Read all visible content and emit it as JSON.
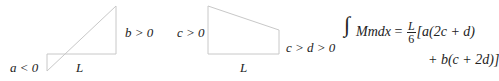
{
  "figure1": {
    "labels": {
      "a": "a < 0",
      "b": "b > 0",
      "length": "L"
    }
  },
  "figure2": {
    "labels": {
      "c": "c > 0",
      "cd": "c > d > 0",
      "length": "L"
    }
  },
  "formula": {
    "integral_sign": "∫",
    "lhs": "Mmdx",
    "equals": "=",
    "frac_num": "L",
    "frac_den": "6",
    "line1_rest": "[a(2c + d)",
    "line2": "+ b(c + 2d)]"
  },
  "colors": {
    "line": "#c8c8c8",
    "text": "#222222"
  }
}
